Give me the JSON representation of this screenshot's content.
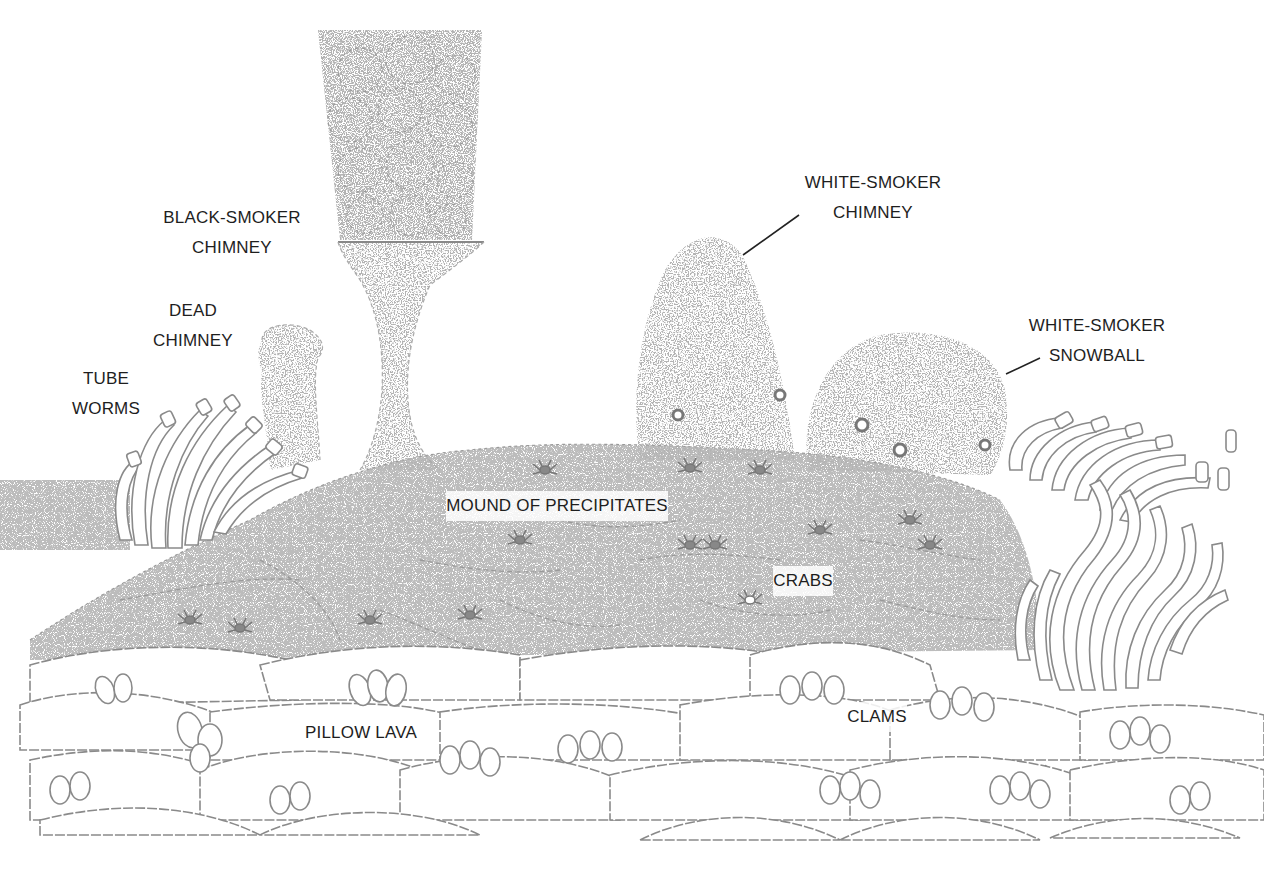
{
  "figure": {
    "line_color": "#8a8a8a",
    "label_color": "#1e1e1e",
    "background": "#ffffff"
  },
  "labels": [
    {
      "id": "black-smoker-chimney",
      "lines": [
        "BLACK-SMOKER",
        "CHIMNEY"
      ],
      "x": 232,
      "y": 203
    },
    {
      "id": "dead-chimney",
      "lines": [
        "DEAD",
        "CHIMNEY"
      ],
      "x": 193,
      "y": 296
    },
    {
      "id": "tube-worms",
      "lines": [
        "TUBE",
        "WORMS"
      ],
      "x": 106,
      "y": 364
    },
    {
      "id": "white-smoker-chimney",
      "lines": [
        "WHITE-SMOKER",
        "CHIMNEY"
      ],
      "x": 873,
      "y": 168,
      "leader": {
        "x1": 799,
        "y1": 215,
        "x2": 743,
        "y2": 255
      }
    },
    {
      "id": "white-smoker-snowball",
      "lines": [
        "WHITE-SMOKER",
        "SNOWBALL"
      ],
      "x": 1097,
      "y": 311,
      "leader": {
        "x1": 1040,
        "y1": 358,
        "x2": 1006,
        "y2": 374
      }
    },
    {
      "id": "mound-of-precipitates",
      "lines": [
        "MOUND OF PRECIPITATES"
      ],
      "x": 557,
      "y": 491
    },
    {
      "id": "crabs",
      "lines": [
        "CRABS"
      ],
      "x": 803,
      "y": 566
    },
    {
      "id": "pillow-lava",
      "lines": [
        "PILLOW LAVA"
      ],
      "x": 361,
      "y": 718
    },
    {
      "id": "clams",
      "lines": [
        "CLAMS"
      ],
      "x": 877,
      "y": 702
    }
  ]
}
